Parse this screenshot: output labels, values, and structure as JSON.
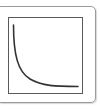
{
  "icon": {
    "name": "decay-curve-plot-icon",
    "colors": {
      "frame": "#9a9a9a",
      "box": "#5a5a5a",
      "curve": "#333333",
      "background": "#ffffff"
    }
  }
}
